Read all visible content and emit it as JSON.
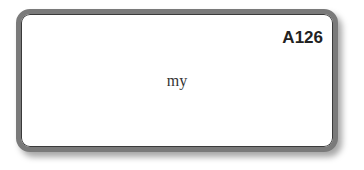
{
  "card": {
    "code": "A126",
    "word": "my"
  }
}
